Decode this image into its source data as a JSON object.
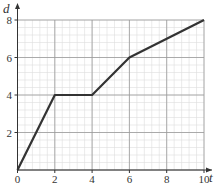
{
  "chart_data": {
    "type": "line",
    "title": "",
    "xlabel": "t",
    "ylabel": "d",
    "x": [
      0,
      2,
      4,
      6,
      10
    ],
    "series": [
      {
        "name": "d",
        "values": [
          0,
          4,
          4,
          6,
          8
        ]
      }
    ],
    "xlim": [
      0,
      10
    ],
    "ylim": [
      0,
      8
    ],
    "x_ticks": [
      "0",
      "2",
      "4",
      "6",
      "8",
      "10"
    ],
    "y_ticks": [
      "2",
      "4",
      "6",
      "8"
    ],
    "grid": true,
    "minor_grid": true,
    "legend": "none"
  },
  "colors": {
    "line": "#333333",
    "major_grid": "#999999",
    "minor_grid": "#dddddd",
    "axis": "#333333"
  }
}
